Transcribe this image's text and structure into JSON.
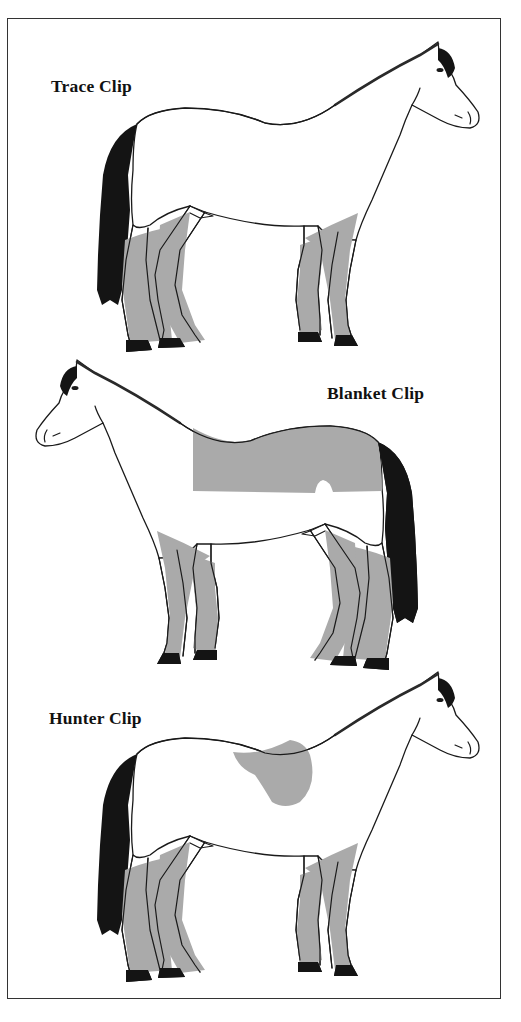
{
  "figure": {
    "panels": [
      {
        "label": "Trace Clip",
        "facing": "right",
        "clipped_area": "neck, upper body and upper legs above trace line"
      },
      {
        "label": "Blanket Clip",
        "facing": "left",
        "clipped_area": "back and loins (blanket-shaped area) plus legs"
      },
      {
        "label": "Hunter Clip",
        "facing": "right",
        "clipped_area": "entire body except saddle patch and legs"
      }
    ],
    "colors": {
      "clipped_fill": "#aaaaaa",
      "outline": "#1a1a1a",
      "mane_tail_hooves": "#141414",
      "background": "#ffffff",
      "frame": "#333333"
    }
  }
}
